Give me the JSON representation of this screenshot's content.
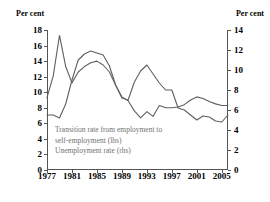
{
  "chart_data": {
    "type": "line",
    "title": "",
    "xlabel": "",
    "ylabel_left": "Per cent",
    "ylabel_right": "Per cent",
    "grid": false,
    "legend_position": "inside-lower-left",
    "x": [
      1977,
      1978,
      1979,
      1980,
      1981,
      1982,
      1983,
      1984,
      1985,
      1986,
      1987,
      1988,
      1989,
      1990,
      1991,
      1992,
      1993,
      1994,
      1995,
      1996,
      1997,
      1998,
      1999,
      2000,
      2001,
      2002,
      2003,
      2004,
      2005,
      2006
    ],
    "xlim": [
      1977,
      2006
    ],
    "xticks": [
      1977,
      1981,
      1985,
      1989,
      1993,
      1997,
      2001,
      2005
    ],
    "xtick_labels": [
      "1977",
      "1981",
      "1985",
      "1989",
      "1993",
      "1997",
      "2001",
      "2005"
    ],
    "ylim_left": [
      0,
      18
    ],
    "yticks_left": [
      0,
      2,
      4,
      6,
      8,
      10,
      12,
      14,
      16,
      18
    ],
    "ytick_labels_left": [
      "0",
      "2",
      "4",
      "6",
      "8",
      "10",
      "12",
      "14",
      "16",
      "18"
    ],
    "ylim_right": [
      0,
      14
    ],
    "yticks_right": [
      0,
      2,
      4,
      6,
      8,
      10,
      12,
      14
    ],
    "ytick_labels_right": [
      "0",
      "2",
      "4",
      "6",
      "8",
      "10",
      "12",
      "14"
    ],
    "series": [
      {
        "name": "Transition rate from employment to self-employment (lhs)",
        "axis": "left",
        "values": [
          9.3,
          12.1,
          17.3,
          13.3,
          11.2,
          12.6,
          13.3,
          13.8,
          14.0,
          13.5,
          12.6,
          10.9,
          9.4,
          8.9,
          7.6,
          6.7,
          7.5,
          6.9,
          8.3,
          8.0,
          8.0,
          8.1,
          8.4,
          9.0,
          9.4,
          9.2,
          8.8,
          8.5,
          8.3,
          8.3
        ]
      },
      {
        "name": "Unemployment rate (rhs)",
        "axis": "right",
        "values": [
          5.5,
          5.5,
          5.2,
          6.6,
          9.0,
          11.0,
          11.6,
          11.9,
          11.7,
          11.5,
          10.4,
          8.5,
          7.2,
          7.0,
          8.8,
          9.9,
          10.5,
          9.6,
          8.7,
          8.0,
          8.0,
          6.2,
          6.0,
          5.5,
          5.0,
          5.4,
          5.3,
          4.9,
          4.8,
          5.5
        ]
      }
    ],
    "legend": [
      "Transition rate from employment to",
      "self-employment (lhs)",
      "Unemployment rate (rhs)"
    ],
    "colors": {
      "series_line": "#5f5f5f",
      "axis": "#555555",
      "legend_text": "#6f6f6f",
      "tick_text": "#000000"
    }
  }
}
